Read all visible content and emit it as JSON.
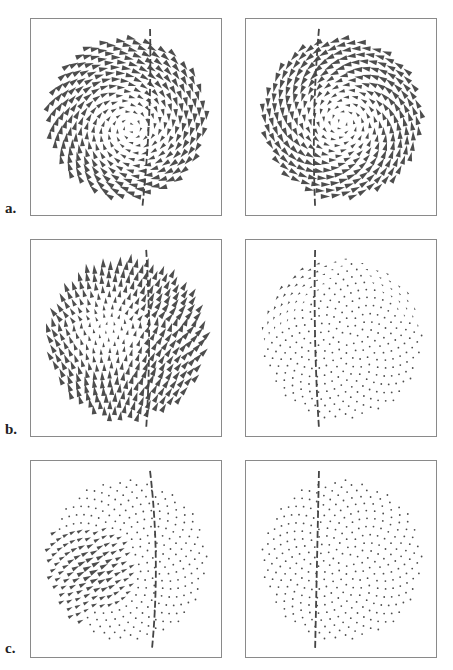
{
  "figure": {
    "rows": [
      {
        "label": "a.",
        "panels": [
          {
            "id": "a-left",
            "field": "swirl",
            "cx": 0.52,
            "cy": 0.55,
            "dir": 1,
            "scale": 1.0,
            "min": 0.35,
            "cut": {
              "x0": 0.62,
              "x1": 0.58,
              "bulge": 0.03
            }
          },
          {
            "id": "a-right",
            "field": "swirl",
            "cx": 0.5,
            "cy": 0.52,
            "dir": -1,
            "scale": 1.0,
            "min": 0.3,
            "cut": {
              "x0": 0.38,
              "x1": 0.36,
              "bulge": -0.03
            }
          }
        ]
      },
      {
        "label": "b.",
        "panels": [
          {
            "id": "b-left",
            "field": "flow-up",
            "cx": 0.4,
            "cy": 0.45,
            "dir": 1,
            "scale": 1.0,
            "min": 0.3,
            "cut": {
              "x0": 0.6,
              "x1": 0.6,
              "bulge": 0.03
            }
          },
          {
            "id": "b-right",
            "field": "fade-topleft",
            "cx": 0.5,
            "cy": 0.5,
            "dir": -1,
            "scale": 0.7,
            "min": 0.15,
            "cut": {
              "x0": 0.36,
              "x1": 0.38,
              "bulge": -0.02
            }
          }
        ]
      },
      {
        "label": "c.",
        "panels": [
          {
            "id": "c-left",
            "field": "cluster",
            "cx": 0.4,
            "cy": 0.48,
            "dir": 1,
            "scale": 1.0,
            "min": 0.1,
            "cut": {
              "x0": 0.62,
              "x1": 0.63,
              "bulge": 0.05
            }
          },
          {
            "id": "c-right",
            "field": "dots",
            "cx": 0.5,
            "cy": 0.5,
            "dir": 1,
            "scale": 0.0,
            "min": 0.1,
            "cut": {
              "x0": 0.38,
              "x1": 0.36,
              "bulge": 0.0
            }
          }
        ]
      }
    ],
    "layout": {
      "col_x": [
        30,
        245
      ],
      "row_y": [
        18,
        239,
        460
      ],
      "panel_w": 192,
      "panel_h": 198,
      "label_x": 5,
      "label_offsets": [
        182,
        182,
        180
      ]
    },
    "style": {
      "glyph_color": "#4d4d4d",
      "dash_color": "#444444",
      "border_color": "#8a8a8a",
      "points_per_panel": 330,
      "disc_radius": 0.42
    }
  }
}
